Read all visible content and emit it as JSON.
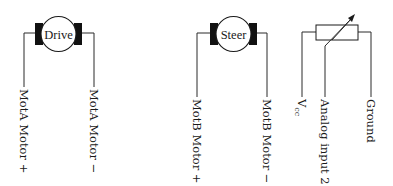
{
  "diagram": {
    "components": [
      {
        "id": "drive-motor",
        "type": "dc-motor",
        "name": "Drive",
        "terminals": [
          {
            "label": "MotA Motor +"
          },
          {
            "label": "MotA Motor −"
          }
        ]
      },
      {
        "id": "steer-motor",
        "type": "dc-motor",
        "name": "Steer",
        "terminals": [
          {
            "label": "MotB Motor +"
          },
          {
            "label": "MotB Motor −"
          }
        ]
      },
      {
        "id": "potentiometer",
        "type": "potentiometer",
        "terminals": [
          {
            "label": "V",
            "subscript": "cc"
          },
          {
            "label": "Analog input 2"
          },
          {
            "label": "Ground"
          }
        ]
      }
    ],
    "colors": {
      "line": "#2a2a2a",
      "brush": "#111111",
      "background": "#ffffff"
    }
  }
}
